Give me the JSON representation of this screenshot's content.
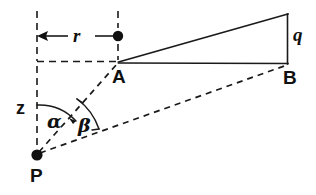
{
  "figure": {
    "type": "geometry-diagram",
    "background_color": "#ffffff",
    "line_color": "#1a1a1a",
    "labels": {
      "point_p": "P",
      "point_a": "A",
      "point_b": "B",
      "radius_r": "r",
      "height_q": "q",
      "axis_z": "z",
      "angle_alpha": "α",
      "angle_beta": "β"
    },
    "points": {
      "P": {
        "x": 37,
        "y": 155
      },
      "A": {
        "x": 118,
        "y": 62
      },
      "B": {
        "x": 288,
        "y": 63
      },
      "apex": {
        "x": 288,
        "y": 14
      },
      "r_dot": {
        "x": 118,
        "y": 36
      }
    },
    "segments": [
      {
        "name": "A-apex",
        "style": "solid",
        "from": "A",
        "to": "apex"
      },
      {
        "name": "A-B",
        "style": "solid",
        "from": "A",
        "to": "B"
      },
      {
        "name": "q-vertical",
        "style": "solid",
        "from": "apex",
        "to": "B"
      },
      {
        "name": "P-A",
        "style": "dashed",
        "from": "P",
        "to": "A"
      },
      {
        "name": "P-B",
        "style": "dashed",
        "from": "P",
        "to": "B"
      },
      {
        "name": "z-axis",
        "style": "dashed",
        "from": "top",
        "to": "P"
      },
      {
        "name": "horizontal-through-A",
        "style": "dashed",
        "from": "z-axis",
        "to": "A"
      },
      {
        "name": "vertical-through-A",
        "style": "dashed",
        "from": "top",
        "to": "A"
      }
    ],
    "angles": [
      {
        "name": "alpha",
        "vertex": "P",
        "between": [
          "z-axis",
          "P-A"
        ]
      },
      {
        "name": "beta",
        "vertex": "P",
        "between": [
          "P-A",
          "P-B"
        ]
      }
    ]
  }
}
